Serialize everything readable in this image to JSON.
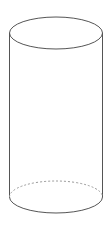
{
  "diagram": {
    "shape": "cylinder",
    "colors": {
      "background": "#ffffff",
      "outline": "#555555",
      "hidden_edge": "#9a9a9a"
    }
  }
}
